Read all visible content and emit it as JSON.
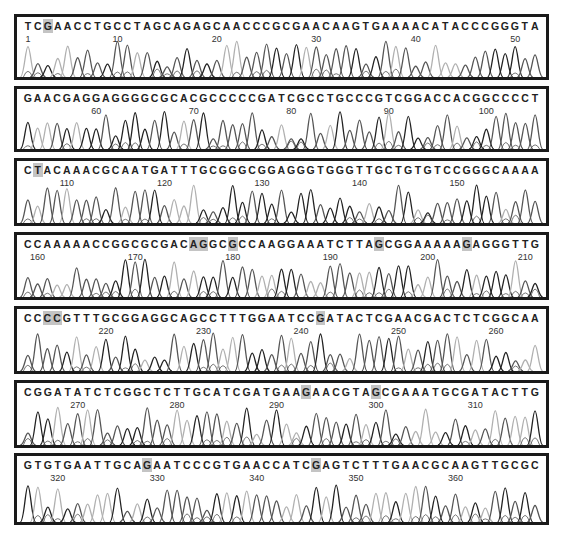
{
  "figure": {
    "type": "DNA sequencing chromatogram",
    "panels": [
      {
        "sequence": "TCGAACCTGCCTAGCAGAGCAACCCGCGAACAAGTGAAAACATACCCGGGTA",
        "start": 1,
        "highlighted_positions": [
          2
        ],
        "tick_labels": [
          "1",
          "10",
          "20",
          "30",
          "40",
          "50"
        ]
      },
      {
        "sequence": "GAACGAGGAGGGGCGCACGCCCCCGATCGCCTGCCCGTCGGACCACGGCCCCT",
        "start": 53,
        "highlighted_positions": [],
        "tick_labels": [
          "60",
          "70",
          "80",
          "90",
          "100"
        ]
      },
      {
        "sequence": "CTACAAACGCAATGATTTGCGGGCGGAGGGTGGGTTGCTGTGTCCGGGCAAAA",
        "start": 106,
        "highlighted_positions": [
          1
        ],
        "tick_labels": [
          "110",
          "120",
          "130",
          "140",
          "150"
        ]
      },
      {
        "sequence": "CCAAAAACCGGCGCGACAGGCGCCAAGGAAATCTTAGCGGAAAAAGAGGGTTG",
        "start": 159,
        "highlighted_positions": [
          17,
          18,
          21,
          36,
          45
        ],
        "tick_labels": [
          "160",
          "170",
          "180",
          "190",
          "200",
          "210"
        ]
      },
      {
        "sequence": "CCCCGTTTGCGGAGGCAGCCTTTGGAATCCGATACTCGAACGACTCTCGGCAA",
        "start": 212,
        "highlighted_positions": [
          2,
          3,
          30
        ],
        "tick_labels": [
          "220",
          "230",
          "240",
          "250",
          "260"
        ]
      },
      {
        "sequence": "CGGATATCTCGGCTCTTGCATCGATGAAGAACGTAGCGAAATGCGATACTTG",
        "start": 265,
        "highlighted_positions": [
          28,
          35
        ],
        "tick_labels": [
          "270",
          "280",
          "290",
          "300",
          "310"
        ]
      },
      {
        "sequence": "GTGTGAATTGCAGAATCCCGTGAACCATCGAGTCTTTGAACGCAAGTTGCGC",
        "start": 317,
        "highlighted_positions": [
          12,
          29
        ],
        "tick_labels": [
          "320",
          "330",
          "340",
          "350",
          "360"
        ]
      }
    ],
    "colors": {
      "frame": "#1a1a1a",
      "highlight": "#c4c4c4",
      "trace_dark": "#222222",
      "trace_light": "#b0b0b0",
      "trace_mid": "#555555"
    }
  }
}
